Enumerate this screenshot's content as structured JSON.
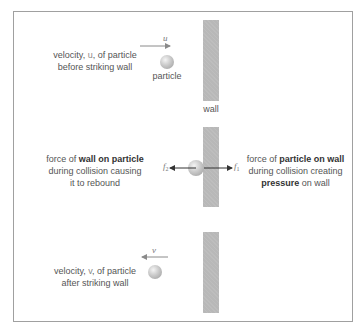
{
  "panels": [
    {
      "id": "before",
      "description_parts": [
        {
          "text": "velocity, "
        },
        {
          "text": "u",
          "symbol": true
        },
        {
          "text": ", of particle"
        }
      ],
      "description_line2": "before striking wall",
      "velocity_symbol": "u",
      "velocity_direction": "right",
      "particle_label": "particle",
      "wall_label": "wall"
    },
    {
      "id": "during",
      "left_text": {
        "line1_plain": "force of ",
        "line1_bold": "wall on particle",
        "line2": "during collision causing",
        "line3": "it to rebound"
      },
      "right_text": {
        "line1_plain": "force of ",
        "line1_bold": "particle on wall",
        "line2": "during collision creating",
        "line3_bold": "pressure",
        "line3_plain": " on wall"
      },
      "force_left": {
        "symbol": "f",
        "subscript": "2"
      },
      "force_right": {
        "symbol": "f",
        "subscript": "1"
      }
    },
    {
      "id": "after",
      "description_line1_pre": "velocity, ",
      "description_symbol": "v",
      "description_line1_post": ", of particle",
      "description_line2": "after striking wall",
      "velocity_symbol": "v",
      "velocity_direction": "left"
    }
  ],
  "colors": {
    "wall": "#b8b8b8",
    "frame": "#a0a0a0",
    "velocity_arrow": "#8a8a8a",
    "force_arrow": "#333333"
  }
}
